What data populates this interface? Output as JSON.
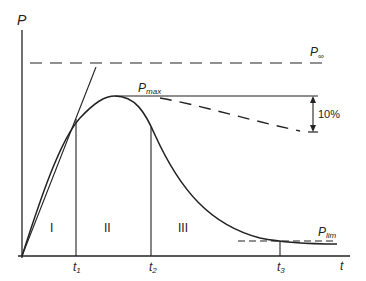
{
  "diagram": {
    "axes": {
      "y_label": "P",
      "x_label": "t"
    },
    "levels": {
      "p_inf": {
        "label": "P",
        "sub": "∞"
      },
      "p_max": {
        "label": "P",
        "sub": "max"
      },
      "p_lim": {
        "label": "P",
        "sub": "lim"
      }
    },
    "annotation_drop": "10%",
    "regions": [
      "I",
      "II",
      "III"
    ],
    "time_marks": [
      {
        "label": "t",
        "sub": "1"
      },
      {
        "label": "t",
        "sub": "2"
      },
      {
        "label": "t",
        "sub": "3"
      }
    ],
    "colors": {
      "stroke": "#222222",
      "background": "#ffffff"
    }
  }
}
